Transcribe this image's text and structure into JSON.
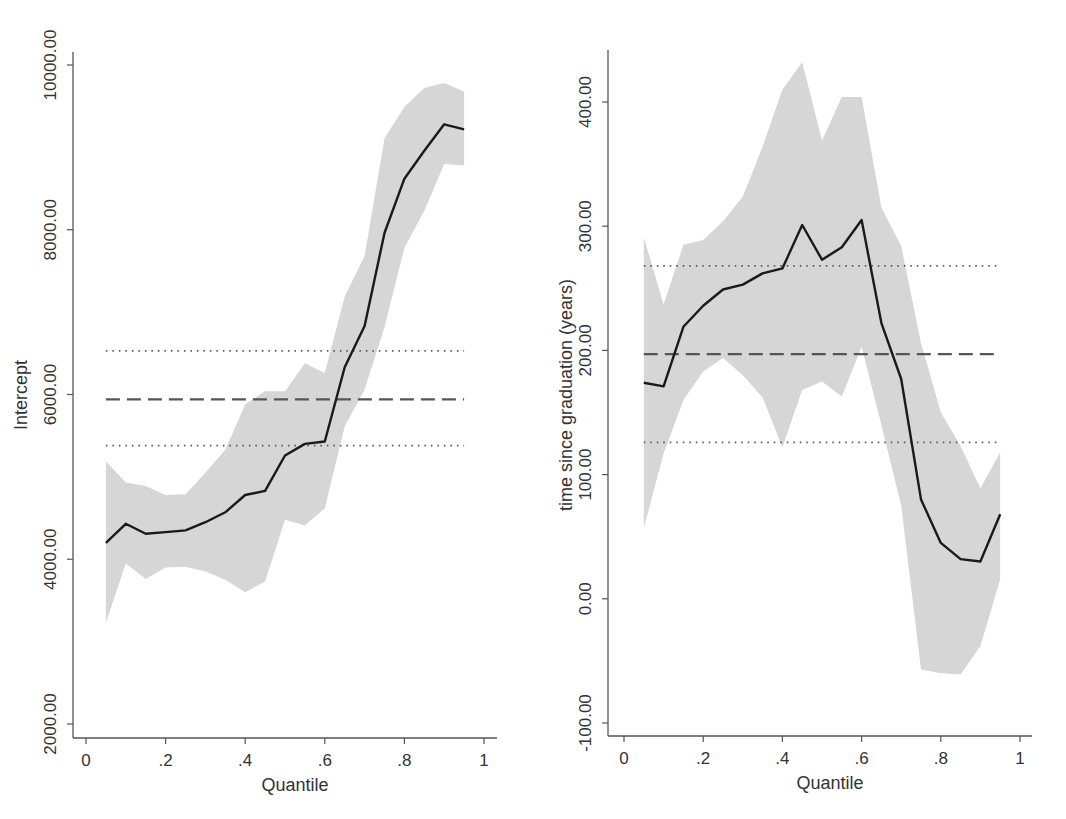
{
  "chart_data": [
    {
      "type": "line",
      "title": "",
      "xlabel": "Quantile",
      "ylabel": "Intercept",
      "xlim": [
        0,
        1
      ],
      "ylim": [
        2000,
        10000
      ],
      "x_ticks": [
        "0",
        ".2",
        ".4",
        ".6",
        ".8",
        "1"
      ],
      "y_ticks": [
        "2000.00",
        "4000.00",
        "6000.00",
        "8000.00",
        "10000.00"
      ],
      "grid": false,
      "legend": null,
      "x": [
        0.05,
        0.1,
        0.15,
        0.2,
        0.25,
        0.3,
        0.35,
        0.4,
        0.45,
        0.5,
        0.55,
        0.6,
        0.65,
        0.7,
        0.75,
        0.8,
        0.85,
        0.9,
        0.95
      ],
      "series": [
        {
          "name": "Quantile regression estimate",
          "style": "solid",
          "values": [
            4200,
            4430,
            4310,
            4330,
            4350,
            4450,
            4570,
            4780,
            4830,
            5260,
            5400,
            5430,
            6330,
            6830,
            7960,
            8620,
            8960,
            9280,
            9220
          ]
        },
        {
          "name": "Confidence band upper",
          "style": "band",
          "values": [
            5190,
            4930,
            4890,
            4780,
            4790,
            5050,
            5330,
            5880,
            6040,
            6040,
            6380,
            6260,
            7190,
            7680,
            9110,
            9490,
            9720,
            9780,
            9680
          ]
        },
        {
          "name": "Confidence band lower",
          "style": "band",
          "values": [
            3230,
            3950,
            3760,
            3900,
            3910,
            3850,
            3750,
            3600,
            3730,
            4480,
            4410,
            4620,
            5610,
            6060,
            6820,
            7780,
            8230,
            8800,
            8780
          ]
        }
      ],
      "reference_lines": [
        {
          "name": "OLS estimate",
          "style": "dashed",
          "value": 5940
        },
        {
          "name": "OLS CI upper",
          "style": "dotted",
          "value": 6530
        },
        {
          "name": "OLS CI lower",
          "style": "dotted",
          "value": 5380
        }
      ]
    },
    {
      "type": "line",
      "title": "",
      "xlabel": "Quantile",
      "ylabel": "time since graduation (years)",
      "xlim": [
        0,
        1
      ],
      "ylim": [
        -100,
        400
      ],
      "x_ticks": [
        "0",
        ".2",
        ".4",
        ".6",
        ".8",
        "1"
      ],
      "y_ticks": [
        "-100.00",
        "0.00",
        "100.00",
        "200.00",
        "300.00",
        "400.00"
      ],
      "grid": false,
      "legend": null,
      "x": [
        0.05,
        0.1,
        0.15,
        0.2,
        0.25,
        0.3,
        0.35,
        0.4,
        0.45,
        0.5,
        0.55,
        0.6,
        0.65,
        0.7,
        0.75,
        0.8,
        0.85,
        0.9,
        0.95
      ],
      "series": [
        {
          "name": "Quantile regression estimate",
          "style": "solid",
          "values": [
            174,
            171,
            219,
            236,
            249,
            253,
            262,
            266,
            301,
            273,
            283,
            305,
            222,
            177,
            80,
            45,
            32,
            30,
            68
          ]
        },
        {
          "name": "Confidence band upper",
          "style": "band",
          "values": [
            291,
            237,
            285,
            289,
            304,
            324,
            364,
            410,
            432,
            369,
            404,
            404,
            315,
            284,
            206,
            150,
            123,
            89,
            118
          ]
        },
        {
          "name": "Confidence band lower",
          "style": "band",
          "values": [
            57,
            117,
            160,
            183,
            194,
            180,
            162,
            122,
            168,
            175,
            163,
            203,
            140,
            75,
            -57,
            -60,
            -61,
            -38,
            16
          ]
        }
      ],
      "reference_lines": [
        {
          "name": "OLS estimate",
          "style": "dashed",
          "value": 197
        },
        {
          "name": "OLS CI upper",
          "style": "dotted",
          "value": 268
        },
        {
          "name": "OLS CI lower",
          "style": "dotted",
          "value": 126
        }
      ]
    }
  ],
  "colors": {
    "band": "#d6d6d6",
    "line": "#1a1a1a",
    "ref_line": "#555555",
    "axis": "#555555",
    "text": "#333333"
  }
}
